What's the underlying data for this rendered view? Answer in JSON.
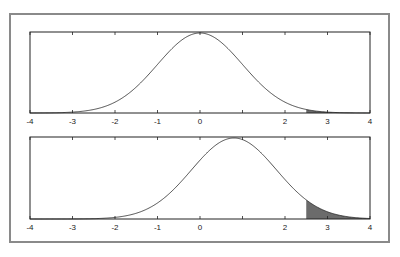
{
  "chart_data": [
    {
      "type": "line",
      "title": "",
      "description": "Standard normal density, mean 0",
      "xlabel": "",
      "ylabel": "",
      "xlim": [
        -4,
        4
      ],
      "x_ticks": [
        -4,
        -3,
        -2,
        -1,
        0,
        1,
        2,
        3,
        4
      ],
      "x_tick_labels": [
        "-4",
        "-3",
        "-2",
        "-1",
        "0",
        "",
        "2",
        "3",
        "4"
      ],
      "series": [
        {
          "name": "null distribution",
          "mean": 0,
          "sd": 1
        }
      ],
      "shaded_region": {
        "from": 2.5,
        "to": 4
      },
      "grid": false,
      "legend": null
    },
    {
      "type": "area",
      "title": "",
      "description": "Normal density shifted, mean ~0.8, right tail shaded",
      "xlabel": "",
      "ylabel": "",
      "xlim": [
        -4,
        4
      ],
      "x_ticks": [
        -4,
        -3,
        -2,
        -1,
        0,
        1,
        2,
        3,
        4
      ],
      "x_tick_labels": [
        "-4",
        "-3",
        "-2",
        "-1",
        "0",
        "",
        "2",
        "3",
        "4"
      ],
      "series": [
        {
          "name": "alternative distribution",
          "mean": 0.8,
          "sd": 1
        }
      ],
      "shaded_region": {
        "from": 2.5,
        "to": 4,
        "color": "#6b6b6b"
      },
      "grid": false,
      "legend": null
    }
  ],
  "labels": {
    "ticks": [
      "-4",
      "-3",
      "-2",
      "-1",
      "0",
      "",
      "2",
      "3",
      "4"
    ]
  },
  "colors": {
    "frame": "#8a8a8a",
    "axis": "#222222",
    "shade": "#6b6b6b"
  }
}
